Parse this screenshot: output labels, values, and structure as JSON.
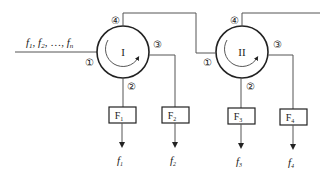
{
  "diagram": {
    "input_label": "f₁, f₂, …, fₙ",
    "input_parts": [
      {
        "base": "f",
        "sub": "1"
      },
      {
        "base": "f",
        "sub": "2"
      },
      {
        "base": "f",
        "sub": "n"
      }
    ],
    "separator": ", ",
    "ellipsis": "…",
    "circulators": [
      {
        "id": "I",
        "label": "I",
        "ports": {
          "p1": "①",
          "p2": "②",
          "p3": "③",
          "p4": "④"
        }
      },
      {
        "id": "II",
        "label": "II",
        "ports": {
          "p1": "①",
          "p2": "②",
          "p3": "③",
          "p4": "④"
        }
      }
    ],
    "filters": [
      {
        "label": "F",
        "sub": "1",
        "output_base": "f",
        "output_sub": "1"
      },
      {
        "label": "F",
        "sub": "2",
        "output_base": "f",
        "output_sub": "2"
      },
      {
        "label": "F",
        "sub": "3",
        "output_base": "f",
        "output_sub": "3"
      },
      {
        "label": "F",
        "sub": "4",
        "output_base": "f",
        "output_sub": "4"
      }
    ]
  },
  "colors": {
    "line": "#555555",
    "circle": "#222222",
    "text": "#222222",
    "background": "#ffffff"
  }
}
